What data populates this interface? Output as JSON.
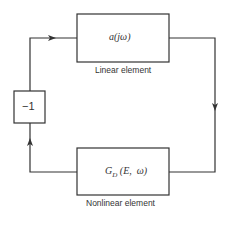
{
  "diagram": {
    "type": "feedback-loop block diagram",
    "blocks": [
      {
        "id": "linear",
        "expression": "a(jω)",
        "caption": "Linear element"
      },
      {
        "id": "nonlinear",
        "expression": "G_D (E, ω)",
        "expression_main": "G",
        "expression_sub": "D",
        "expression_rest": " (E,  ω)",
        "caption": "Nonlinear element"
      },
      {
        "id": "gain",
        "expression": "−1"
      }
    ],
    "connections": [
      {
        "from": "gain",
        "to": "linear",
        "arrow": "right"
      },
      {
        "from": "linear",
        "to": "nonlinear",
        "arrow": "down"
      },
      {
        "from": "nonlinear",
        "to": "gain",
        "arrow": "up"
      }
    ],
    "colors": {
      "stroke": "#333333",
      "background": "#ffffff"
    }
  }
}
